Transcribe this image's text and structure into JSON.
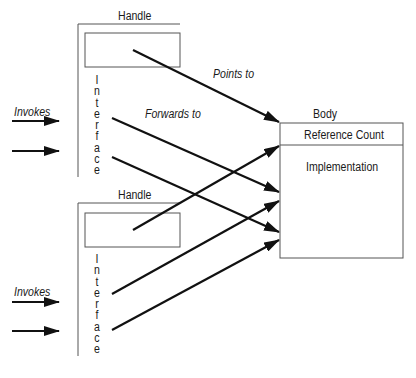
{
  "handles": [
    {
      "label": "Handle",
      "interface_label": "Interface"
    },
    {
      "label": "Handle",
      "interface_label": "Interface"
    }
  ],
  "body": {
    "label": "Body",
    "reference_count": "Reference Count",
    "implementation": "Implementation"
  },
  "edge_labels": {
    "points_to": "Points to",
    "forwards_to": "Forwards to",
    "invokes_top": "Invokes",
    "invokes_bottom": "Invokes"
  },
  "colors": {
    "line": "#111111",
    "box": "#555555"
  }
}
